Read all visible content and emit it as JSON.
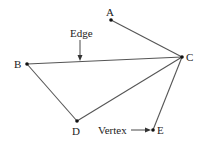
{
  "diagram": {
    "type": "graph",
    "vertices": [
      {
        "id": "A",
        "label": "A",
        "x": 111,
        "y": 20
      },
      {
        "id": "B",
        "label": "B",
        "x": 27,
        "y": 64
      },
      {
        "id": "C",
        "label": "C",
        "x": 182,
        "y": 57
      },
      {
        "id": "D",
        "label": "D",
        "x": 77,
        "y": 121
      },
      {
        "id": "E",
        "label": "E",
        "x": 153,
        "y": 130
      }
    ],
    "edges": [
      {
        "from": "A",
        "to": "C"
      },
      {
        "from": "B",
        "to": "C"
      },
      {
        "from": "B",
        "to": "D"
      },
      {
        "from": "D",
        "to": "C"
      },
      {
        "from": "E",
        "to": "C"
      }
    ],
    "annotations": {
      "edge_label": "Edge",
      "vertex_label": "Vertex"
    },
    "colors": {
      "line": "#555555",
      "dot": "#111111",
      "text": "#222222"
    }
  }
}
